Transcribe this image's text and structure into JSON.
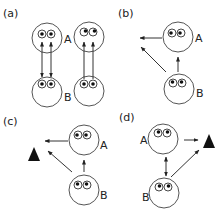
{
  "figure": {
    "type": "diagram",
    "colors": {
      "stroke": "#333333",
      "fill": "#ffffff",
      "object": "#111111"
    }
  },
  "panels": [
    {
      "id": "a",
      "label": "(a)",
      "nodes": [
        {
          "id": "A1",
          "label": "A",
          "kind": "agent"
        },
        {
          "id": "B1",
          "label": "B",
          "kind": "agent"
        },
        {
          "id": "A2",
          "label": "",
          "kind": "agent"
        },
        {
          "id": "B2",
          "label": "",
          "kind": "agent"
        }
      ],
      "edges": [
        {
          "from": "B1",
          "to": "A1",
          "type": "bidirectional",
          "count": 2
        },
        {
          "from": "B2",
          "to": "A2",
          "type": "directed",
          "count": 2
        }
      ]
    },
    {
      "id": "b",
      "label": "(b)",
      "nodes": [
        {
          "id": "A",
          "label": "A",
          "kind": "agent"
        },
        {
          "id": "B",
          "label": "B",
          "kind": "agent"
        }
      ],
      "edges": [
        {
          "from": "A",
          "to": "left",
          "type": "directed"
        },
        {
          "from": "B",
          "to": "A",
          "type": "directed"
        },
        {
          "from": "B",
          "to": "upper-left",
          "type": "directed"
        }
      ]
    },
    {
      "id": "c",
      "label": "(c)",
      "nodes": [
        {
          "id": "A",
          "label": "A",
          "kind": "agent"
        },
        {
          "id": "B",
          "label": "B",
          "kind": "agent"
        },
        {
          "id": "obj",
          "label": "",
          "kind": "object-triangle"
        }
      ],
      "edges": [
        {
          "from": "A",
          "to": "obj",
          "type": "directed"
        },
        {
          "from": "B",
          "to": "A",
          "type": "directed"
        },
        {
          "from": "B",
          "to": "obj",
          "type": "directed"
        }
      ]
    },
    {
      "id": "d",
      "label": "(d)",
      "nodes": [
        {
          "id": "A",
          "label": "A",
          "kind": "agent"
        },
        {
          "id": "B",
          "label": "B",
          "kind": "agent"
        },
        {
          "id": "obj",
          "label": "",
          "kind": "object-triangle"
        }
      ],
      "edges": [
        {
          "from": "A",
          "to": "obj",
          "type": "directed"
        },
        {
          "from": "A",
          "to": "B",
          "type": "bidirectional"
        },
        {
          "from": "B",
          "to": "obj",
          "type": "directed"
        }
      ]
    }
  ]
}
